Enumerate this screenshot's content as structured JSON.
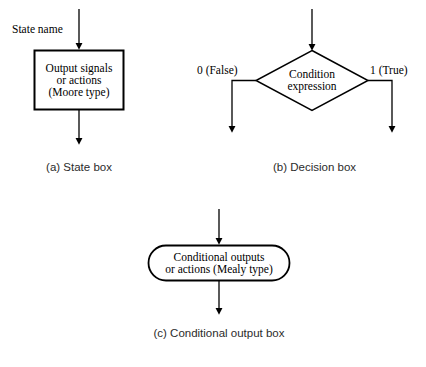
{
  "figure": {
    "background_color": "#ffffff",
    "line_color": "#000000"
  },
  "state_box": {
    "input_label": "State name",
    "lines": [
      "Output signals",
      "or actions",
      "(Moore type)"
    ],
    "caption": "(a) State box",
    "shape": "rectangle"
  },
  "decision_box": {
    "lines": [
      "Condition",
      "expression"
    ],
    "false_label": "0 (False)",
    "true_label": "1 (True)",
    "caption": "(b) Decision box",
    "shape": "diamond"
  },
  "conditional_output_box": {
    "lines": [
      "Conditional outputs",
      "or actions (Mealy type)"
    ],
    "caption": "(c) Conditional output box",
    "shape": "rounded-rectangle"
  },
  "footer": {
    "faint_text": ""
  }
}
